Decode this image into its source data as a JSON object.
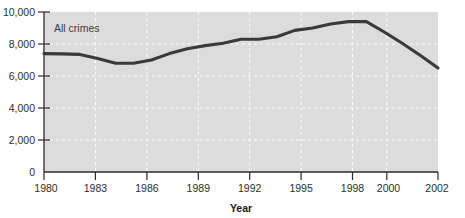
{
  "figure": {
    "clipped_title_fragment": "Rate per 100,000 population aged 10 and over"
  },
  "chart_data": {
    "type": "line",
    "title": "",
    "xlabel": "Year",
    "ylabel": "",
    "series_label": "All crimes",
    "xlim": [
      1980,
      2002
    ],
    "ylim": [
      0,
      10000
    ],
    "grid": true,
    "grid_style": "white dashed horizontal and vertical",
    "legend_position": "inside-top-left",
    "plot_background": "#dcdcdc",
    "line_color": "#3a3a3a",
    "x_tick_labels": [
      "1980",
      "1983",
      "1986",
      "1989",
      "1992",
      "1995",
      "1998",
      "2000",
      "2002"
    ],
    "x_ticks": [
      1980,
      1983,
      1986,
      1989,
      1992,
      1995,
      1998,
      2000,
      2002
    ],
    "y_tick_labels": [
      "0",
      "2,000",
      "4,000",
      "6,000",
      "8,000",
      "10,000"
    ],
    "y_ticks": [
      0,
      2000,
      4000,
      6000,
      8000,
      10000
    ],
    "x": [
      1980,
      1981,
      1982,
      1983,
      1984,
      1985,
      1986,
      1987,
      1988,
      1989,
      1990,
      1991,
      1992,
      1993,
      1994,
      1995,
      1996,
      1997,
      1998,
      1999,
      2000,
      2001,
      2002
    ],
    "values": [
      7400,
      7380,
      7350,
      7100,
      6800,
      6800,
      7000,
      7400,
      7700,
      7900,
      8050,
      8300,
      8300,
      8450,
      8850,
      9000,
      9250,
      9400,
      9400,
      8750,
      8050,
      7300,
      6500
    ],
    "series": [
      {
        "name": "All crimes",
        "values": [
          7400,
          7380,
          7350,
          7100,
          6800,
          6800,
          7000,
          7400,
          7700,
          7900,
          8050,
          8300,
          8300,
          8450,
          8850,
          9000,
          9250,
          9400,
          9400,
          8750,
          8050,
          7300,
          6500
        ]
      }
    ]
  }
}
